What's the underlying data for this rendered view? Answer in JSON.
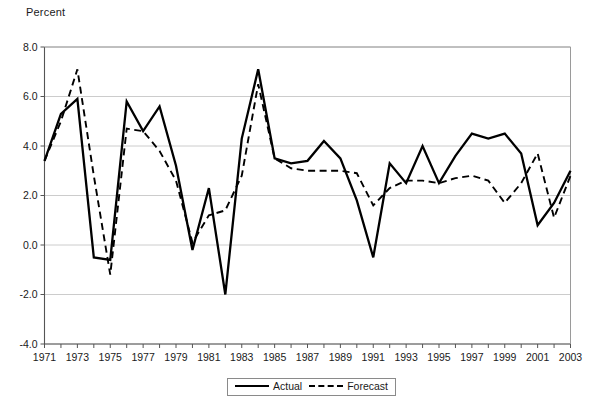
{
  "chart_data": {
    "type": "line",
    "title": "",
    "ylabel": "Percent",
    "xlabel": "",
    "ylim": [
      -4.0,
      8.0
    ],
    "xlim": [
      1971,
      2003
    ],
    "grid": true,
    "legend_position": "bottom-center",
    "yticks": [
      "8.0",
      "6.0",
      "4.0",
      "2.0",
      "0.0",
      "-2.0",
      "-4.0"
    ],
    "ytick_values": [
      8.0,
      6.0,
      4.0,
      2.0,
      0.0,
      -2.0,
      -4.0
    ],
    "xticks": [
      "1971",
      "1973",
      "1975",
      "1977",
      "1979",
      "1981",
      "1983",
      "1985",
      "1987",
      "1989",
      "1991",
      "1993",
      "1995",
      "1997",
      "1999",
      "2001",
      "2003"
    ],
    "x": [
      1971,
      1972,
      1973,
      1974,
      1975,
      1976,
      1977,
      1978,
      1979,
      1980,
      1981,
      1982,
      1983,
      1984,
      1985,
      1986,
      1987,
      1988,
      1989,
      1990,
      1991,
      1992,
      1993,
      1994,
      1995,
      1996,
      1997,
      1998,
      1999,
      2000,
      2001,
      2002,
      2003
    ],
    "series": [
      {
        "name": "Actual",
        "style": "solid",
        "color": "#000000",
        "values": [
          3.4,
          5.3,
          5.9,
          -0.5,
          -0.6,
          5.8,
          4.6,
          5.6,
          3.2,
          -0.2,
          2.3,
          -2.0,
          4.3,
          7.1,
          3.5,
          3.3,
          3.4,
          4.2,
          3.5,
          1.8,
          -0.5,
          3.3,
          2.5,
          4.0,
          2.5,
          3.6,
          4.5,
          4.3,
          4.5,
          3.7,
          0.8,
          1.7,
          3.0
        ]
      },
      {
        "name": "Forecast",
        "style": "dashed",
        "color": "#000000",
        "values": [
          3.4,
          5.0,
          7.1,
          2.8,
          -1.2,
          4.7,
          4.6,
          3.8,
          2.6,
          0.1,
          1.2,
          1.4,
          2.8,
          6.5,
          3.5,
          3.1,
          3.0,
          3.0,
          3.0,
          2.9,
          1.6,
          2.3,
          2.6,
          2.6,
          2.5,
          2.7,
          2.8,
          2.6,
          1.7,
          2.5,
          3.7,
          1.1,
          2.8
        ]
      }
    ]
  },
  "legend": {
    "entries": [
      {
        "label": "Actual",
        "style": "solid"
      },
      {
        "label": "Forecast",
        "style": "dashed"
      }
    ]
  }
}
